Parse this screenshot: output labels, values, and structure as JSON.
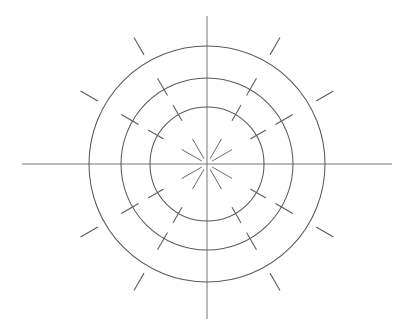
{
  "diagram": {
    "type": "polar-ring-diagram",
    "background_color": "#ffffff",
    "canvas": {
      "width": 406,
      "height": 326
    },
    "center": {
      "x": 207,
      "y": 164
    },
    "axes": {
      "color": "#767676",
      "stroke_width": 1,
      "horizontal": {
        "label": "horizontal-axis",
        "x1": 22,
        "y1": 164,
        "x2": 392,
        "y2": 164
      },
      "vertical": {
        "label": "vertical-axis",
        "x1": 207,
        "y1": 16,
        "x2": 207,
        "y2": 319
      }
    },
    "rings": [
      {
        "name": "inner-ring",
        "radius": 57,
        "color": "#5a5a5a",
        "stroke_width": 1.05
      },
      {
        "name": "middle-ring",
        "radius": 86,
        "color": "#5a5a5a",
        "stroke_width": 1.05
      },
      {
        "name": "outer-ring",
        "radius": 118,
        "color": "#5a5a5a",
        "stroke_width": 1.05
      }
    ],
    "tick_angles_deg": [
      30,
      60,
      120,
      150,
      210,
      240,
      300,
      330
    ],
    "tick_marks": [
      {
        "name": "inner-ring-ticks",
        "ring_radius": 57,
        "inner_offset": -7,
        "outer_offset": 11,
        "color": "#5a5a5a"
      },
      {
        "name": "middle-ring-ticks",
        "ring_radius": 86,
        "inner_offset": -7,
        "outer_offset": 13,
        "color": "#5a5a5a"
      },
      {
        "name": "outer-ring-ticks",
        "ring_radius": 118,
        "inner_offset": 8,
        "outer_offset": 28,
        "color": "#5a5a5a"
      }
    ],
    "inner_rays": {
      "name": "center-rays",
      "count": 8,
      "start_radius": 6,
      "end_radius": 29,
      "color": "#6a6a6a",
      "angles_deg": [
        30,
        60,
        120,
        150,
        210,
        240,
        300,
        330
      ]
    }
  }
}
